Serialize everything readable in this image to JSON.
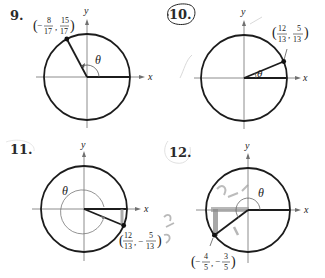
{
  "problems": [
    {
      "number": "9.",
      "point_label": {
        "x_num": "8",
        "x_den": "17",
        "x_sign": "−",
        "y_num": "15",
        "y_den": "17",
        "y_sign": ""
      },
      "point": [
        -0.4706,
        0.8824
      ],
      "angle_label": "θ",
      "axis_x": "x",
      "axis_y": "y",
      "circled": false
    },
    {
      "number": "10.",
      "point_label": {
        "x_num": "12",
        "x_den": "13",
        "x_sign": "",
        "y_num": "5",
        "y_den": "13",
        "y_sign": ""
      },
      "point": [
        0.9231,
        0.3846
      ],
      "angle_label": "θ",
      "axis_x": "x",
      "axis_y": "y",
      "circled": true
    },
    {
      "number": "11.",
      "point_label": {
        "x_num": "12",
        "x_den": "13",
        "x_sign": "",
        "y_num": "5",
        "y_den": "13",
        "y_sign": "−"
      },
      "point": [
        0.9231,
        -0.3846
      ],
      "angle_label": "θ",
      "axis_x": "x",
      "axis_y": "y",
      "circled": false
    },
    {
      "number": "12.",
      "point_label": {
        "x_num": "4",
        "x_den": "5",
        "x_sign": "−",
        "y_num": "3",
        "y_den": "5",
        "y_sign": "−"
      },
      "point": [
        -0.8,
        -0.6
      ],
      "angle_label": "θ",
      "axis_x": "x",
      "axis_y": "y",
      "circled": false
    }
  ],
  "annotations": {
    "handwritten_12": [
      "√3 −√5",
      "3/5",
      "4"
    ]
  },
  "colors": {
    "ink": "#1a1a1a",
    "axis": "#6b6b6b",
    "pencil": "#8a8a8a",
    "circle": "#1c1c1c"
  }
}
